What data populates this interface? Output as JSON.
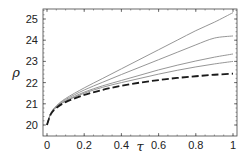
{
  "chart_data": {
    "type": "line",
    "title": "",
    "xlabel": "τ",
    "ylabel": "ρ",
    "xlim": [
      0,
      1
    ],
    "ylim": [
      19.8,
      25.6
    ],
    "xticks": [
      0,
      0.2,
      0.4,
      0.6,
      0.8,
      1
    ],
    "xtick_labels": [
      "0",
      "0.2",
      "0.4",
      "0.6",
      "0.8",
      "1"
    ],
    "yticks": [
      20,
      21,
      22,
      23,
      24,
      25
    ],
    "ytick_labels": [
      "20",
      "21",
      "22",
      "23",
      "24",
      "25"
    ],
    "grid": false,
    "legend": null,
    "x": [
      0,
      0.02,
      0.05,
      0.1,
      0.2,
      0.3,
      0.4,
      0.5,
      0.6,
      0.7,
      0.8,
      0.9,
      1.0
    ],
    "series": [
      {
        "name": "curve-1",
        "style": "solid",
        "values": [
          20.0,
          20.55,
          20.9,
          21.25,
          21.75,
          22.2,
          22.65,
          23.1,
          23.55,
          24.0,
          24.45,
          24.85,
          25.3
        ]
      },
      {
        "name": "curve-2",
        "style": "solid",
        "values": [
          20.0,
          20.55,
          20.88,
          21.2,
          21.65,
          22.02,
          22.38,
          22.73,
          23.08,
          23.43,
          23.78,
          24.1,
          24.2
        ]
      },
      {
        "name": "curve-3",
        "style": "solid",
        "values": [
          20.0,
          20.53,
          20.85,
          21.15,
          21.55,
          21.85,
          22.1,
          22.35,
          22.6,
          22.82,
          23.02,
          23.2,
          23.35
        ]
      },
      {
        "name": "curve-4",
        "style": "solid",
        "values": [
          20.0,
          20.52,
          20.83,
          21.12,
          21.5,
          21.78,
          22.0,
          22.2,
          22.4,
          22.58,
          22.74,
          22.88,
          23.0
        ]
      },
      {
        "name": "curve-5",
        "style": "dashed",
        "values": [
          20.0,
          20.5,
          20.8,
          21.08,
          21.42,
          21.66,
          21.85,
          22.0,
          22.12,
          22.22,
          22.3,
          22.37,
          22.42
        ]
      }
    ]
  },
  "colors": {
    "solid_line": "#8a8a8a",
    "dashed_line": "#1a1a1a",
    "frame": "#444444"
  }
}
